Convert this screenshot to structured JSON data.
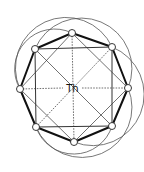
{
  "diagram": {
    "center_label": "Th",
    "nodes": [
      {
        "id": "top",
        "x": 72,
        "y": 33
      },
      {
        "id": "upper-right",
        "x": 112,
        "y": 47
      },
      {
        "id": "right",
        "x": 128,
        "y": 88
      },
      {
        "id": "lower-right",
        "x": 112,
        "y": 126
      },
      {
        "id": "bottom",
        "x": 74,
        "y": 142
      },
      {
        "id": "lower-left",
        "x": 36,
        "y": 127
      },
      {
        "id": "left",
        "x": 20,
        "y": 89
      },
      {
        "id": "upper-left",
        "x": 35,
        "y": 49
      }
    ],
    "colors": {
      "line": "#333333",
      "thick_edge": "#111111",
      "node_fill": "#ffffff",
      "background": "#ffffff"
    }
  }
}
